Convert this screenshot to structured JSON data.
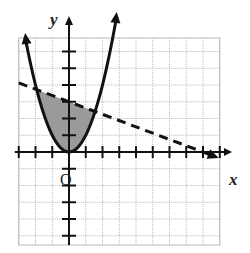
{
  "chart_data": {
    "type": "line",
    "title": "",
    "xlabel": "x",
    "ylabel": "y",
    "origin_label": "O",
    "xlim": [
      -3,
      9
    ],
    "ylim": [
      -5,
      7
    ],
    "grid": true,
    "unit": 1,
    "series": [
      {
        "name": "parabola",
        "equation": "y = x^2",
        "style": "solid",
        "arrows": "both ends",
        "x": [
          -2.6,
          -2,
          -1,
          0,
          1,
          2,
          2.9
        ],
        "y": [
          6.76,
          4,
          1,
          0,
          1,
          4,
          7
        ]
      },
      {
        "name": "boundary line",
        "equation": "y = 3 - (3/8)x",
        "style": "dashed",
        "arrows": "right end",
        "x": [
          -3,
          0,
          8,
          8.8
        ],
        "y": [
          4.1,
          3,
          0,
          -0.3
        ]
      }
    ],
    "shaded_region": {
      "description": "region above the parabola y = x^2 and below the dashed line",
      "fill_color": "#9a9a9a"
    },
    "colors": {
      "grid": "#b8b8b8",
      "axes": "#111111",
      "curves": "#111111",
      "shade": "#9a9a9a"
    }
  }
}
